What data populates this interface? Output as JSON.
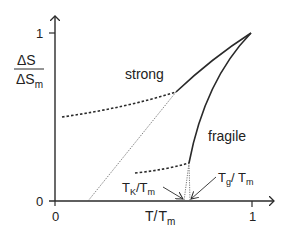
{
  "y_axis": {
    "numerator": "ΔS",
    "denominator": "ΔS",
    "denominator_sub": "m",
    "tick_1": "1",
    "tick_0": "0"
  },
  "x_axis": {
    "label_main": "T/",
    "label_T": "T",
    "label_sub": "m",
    "tick_0": "0",
    "tick_1": "1"
  },
  "labels": {
    "strong": "strong",
    "fragile": "fragile",
    "tk_T": "T",
    "tk_sub": "K",
    "tk_rest": "/T",
    "tk_m": "m",
    "tg_T": "T",
    "tg_sub": "g",
    "tg_rest": "/ T",
    "tg_m": "m"
  },
  "colors": {
    "line": "#2a2a2a",
    "background": "#ffffff"
  }
}
